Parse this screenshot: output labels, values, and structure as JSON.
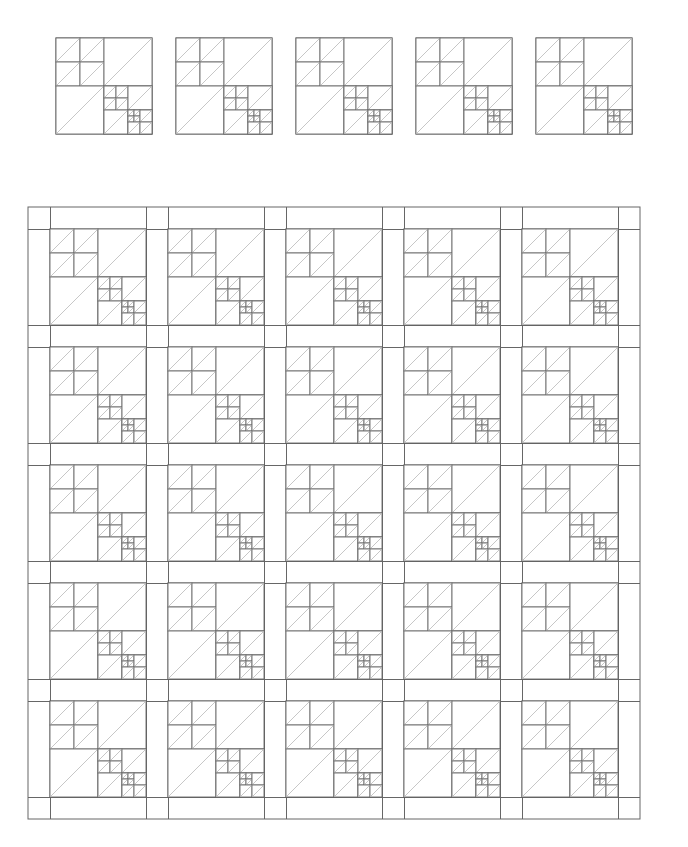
{
  "document": {
    "title": "Recursive Half-Square-Triangle Quilt Layout",
    "background_color": "#ffffff",
    "width": 688,
    "height": 847
  },
  "style": {
    "block_outline_color": "#555555",
    "block_outline_width": 1.0,
    "seam_line_color": "#6a6a6a",
    "seam_line_width": 0.9,
    "diagonal_color": "#b9b9b9",
    "diagonal_width": 0.8,
    "sashing_color": "#666666",
    "sashing_width": 1.0,
    "fill_color": "#ffffff"
  },
  "block_design": {
    "name": "recursive-hst-block",
    "description": "Square divided into four quadrants. Top-left quadrant is a 2x2 pinwheel of half-square triangles. Top-right and bottom-left quadrants are single half-square triangles. Bottom-right quadrant repeats the same design at half scale.",
    "recursion_depth": 3,
    "quadrants": [
      {
        "position": "top-left",
        "type": "pinwheel-2x2-hst",
        "cells": 4
      },
      {
        "position": "top-right",
        "type": "single-hst",
        "cells": 1
      },
      {
        "position": "bottom-left",
        "type": "single-hst",
        "cells": 1
      },
      {
        "position": "bottom-right",
        "type": "recursive-block",
        "cells": 1
      }
    ],
    "diagonal_direction": "bottom-left-to-top-right"
  },
  "sample_row": {
    "name": "block-sample-row",
    "count": 5,
    "block_size": 96,
    "gap": 24,
    "origin_x": 56,
    "origin_y": 38,
    "labels": [
      "block-1",
      "block-2",
      "block-3",
      "block-4",
      "block-5"
    ]
  },
  "quilt_layout": {
    "name": "quilt-top-layout",
    "rows": 5,
    "columns": 5,
    "block_size": 96,
    "sashing_width": 22,
    "border_width": 22,
    "origin_x": 28,
    "origin_y": 207,
    "total_width": 630,
    "total_height": 621,
    "block_count": 25
  }
}
